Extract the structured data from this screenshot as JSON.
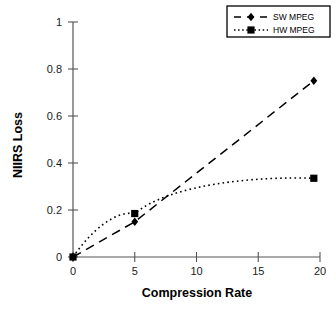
{
  "chart_data": {
    "type": "line",
    "title": "",
    "xlabel": "Compression Rate",
    "ylabel": "NIIRS Loss",
    "xlim": [
      0,
      20
    ],
    "ylim": [
      0,
      1
    ],
    "xticks": [
      "0",
      "5",
      "10",
      "15",
      "20"
    ],
    "xtick_values": [
      0,
      5,
      10,
      15,
      20
    ],
    "yticks": [
      "0",
      "0.2",
      "0.4",
      "0.6",
      "0.8",
      "1"
    ],
    "ytick_values": [
      0,
      0.2,
      0.4,
      0.6,
      0.8,
      1
    ],
    "grid": false,
    "legend_position": "top-right",
    "series": [
      {
        "name": "SW MPEG",
        "marker": "diamond",
        "linestyle": "dashed",
        "color": "#000000",
        "x": [
          0,
          5,
          19.5
        ],
        "values": [
          0,
          0.15,
          0.75
        ]
      },
      {
        "name": "HW MPEG",
        "marker": "square",
        "linestyle": "dotted",
        "color": "#000000",
        "x": [
          0,
          5,
          19.5
        ],
        "values": [
          0,
          0.185,
          0.335
        ]
      }
    ]
  },
  "axes": {
    "x_title": "Compression Rate",
    "y_title": "NIIRS Loss",
    "x_ticks": [
      {
        "label": "0",
        "value": 0
      },
      {
        "label": "5",
        "value": 5
      },
      {
        "label": "10",
        "value": 10
      },
      {
        "label": "15",
        "value": 15
      },
      {
        "label": "20",
        "value": 20
      }
    ],
    "y_ticks": [
      {
        "label": "0",
        "value": 0
      },
      {
        "label": "0.2",
        "value": 0.2
      },
      {
        "label": "0.4",
        "value": 0.4
      },
      {
        "label": "0.6",
        "value": 0.6
      },
      {
        "label": "0.8",
        "value": 0.8
      },
      {
        "label": "1",
        "value": 1
      }
    ]
  },
  "legend": {
    "entries": [
      {
        "label": "SW MPEG",
        "marker": "diamond",
        "linestyle": "dashed"
      },
      {
        "label": "HW MPEG",
        "marker": "square",
        "linestyle": "dotted"
      }
    ]
  },
  "colors": {
    "foreground": "#000000",
    "axis": "#555555",
    "background": "#ffffff"
  }
}
